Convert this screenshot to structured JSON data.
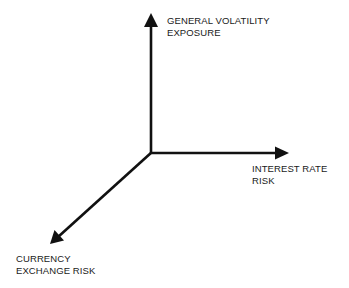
{
  "diagram": {
    "type": "3d-axes",
    "axes": [
      {
        "id": "vertical",
        "direction": "up",
        "label_lines": [
          "GENERAL VOLATILITY",
          "EXPOSURE"
        ]
      },
      {
        "id": "horizontal",
        "direction": "right",
        "label_lines": [
          "INTEREST RATE",
          "RISK"
        ]
      },
      {
        "id": "diagonal",
        "direction": "down-left",
        "label_lines": [
          "CURRENCY",
          "EXCHANGE RISK"
        ]
      }
    ],
    "colors": {
      "axis": "#111111",
      "text": "#1a1a1a",
      "background": "#ffffff"
    }
  }
}
